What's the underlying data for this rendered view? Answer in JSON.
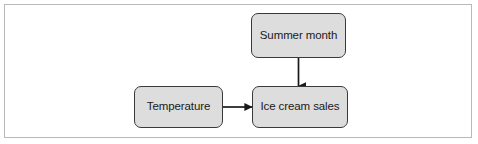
{
  "figure": {
    "type": "causal-diagram",
    "background_color": "#ffffff",
    "frame_border_color": "#b9b9b9"
  },
  "style": {
    "node_fill": "#dddddd",
    "node_border": "#3a3a3a",
    "edge_color": "#1a1a1a",
    "label_color": "#1a1a1a"
  },
  "nodes": [
    {
      "id": "summer-month",
      "label": "Summer month"
    },
    {
      "id": "temperature",
      "label": "Temperature"
    },
    {
      "id": "ice-cream-sales",
      "label": "Ice cream sales"
    }
  ],
  "edges": [
    {
      "id": "summer-month-to-ice-cream-sales",
      "from": "summer-month",
      "to": "ice-cream-sales",
      "direction": "down",
      "arrowhead": "solid-triangle"
    },
    {
      "id": "temperature-to-ice-cream-sales",
      "from": "temperature",
      "to": "ice-cream-sales",
      "direction": "right",
      "arrowhead": "solid-triangle"
    }
  ]
}
